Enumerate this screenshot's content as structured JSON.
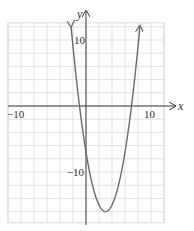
{
  "chart_data": {
    "type": "line",
    "title": "",
    "xlabel": "x",
    "ylabel": "y",
    "xlim": [
      -12,
      12
    ],
    "ylim": [
      -17.7,
      12.6
    ],
    "grid": true,
    "grid_step": 2,
    "x_tick_labels": [
      {
        "value": -10,
        "label": "−10"
      },
      {
        "value": 10,
        "label": "10"
      }
    ],
    "y_tick_labels": [
      {
        "value": 10,
        "label": "10"
      },
      {
        "value": -10,
        "label": "−10"
      }
    ],
    "series": [
      {
        "name": "f(x) = x² − 6x − 7",
        "equation": "y = (x − 3)² − 16",
        "vertex": [
          3,
          -16
        ],
        "x_intercepts": [
          -1,
          7
        ],
        "y_intercept": -7,
        "arrows_at_ends": true,
        "x": [
          -2.3,
          -2,
          -1,
          0,
          1,
          2,
          3,
          4,
          5,
          6,
          7,
          8,
          8.3
        ],
        "y": [
          12.1,
          9,
          0,
          -7,
          -12,
          -15,
          -16,
          -15,
          -12,
          -7,
          0,
          9,
          12.1
        ]
      }
    ],
    "colors": {
      "curve": "#6a6a6a",
      "axis": "#3a3a3a",
      "grid": "#d9d9d9"
    }
  }
}
